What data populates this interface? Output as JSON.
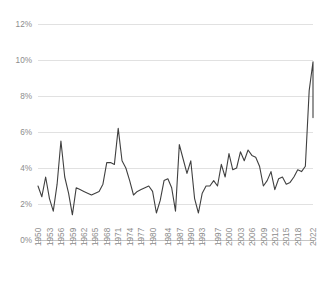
{
  "chart_data": {
    "type": "line",
    "title": "",
    "subtitle": "",
    "xlabel": "",
    "ylabel": "",
    "grid": true,
    "legend": false,
    "legend_position": "none",
    "line_color": "#404040",
    "grid_color": "#d9d9d9",
    "axis_text_color": "#8c8c8c",
    "ylim": [
      0,
      12
    ],
    "ytick_step": 2,
    "ytick_labels": [
      "0%",
      "2%",
      "4%",
      "6%",
      "8%",
      "10%",
      "12%"
    ],
    "ytick_values": [
      0,
      2,
      4,
      6,
      8,
      10,
      12
    ],
    "xlim": [
      1950,
      2022
    ],
    "xtick_labels": [
      "1950",
      "1953",
      "1956",
      "1959",
      "1962",
      "1965",
      "1968",
      "1971",
      "1974",
      "1977",
      "1980",
      "1984",
      "1987",
      "1990",
      "1993",
      "1997",
      "2000",
      "2003",
      "2006",
      "2009",
      "2012",
      "2015",
      "2018",
      "2022"
    ],
    "xtick_values": [
      1950,
      1953,
      1956,
      1959,
      1962,
      1965,
      1968,
      1971,
      1974,
      1977,
      1980,
      1984,
      1987,
      1990,
      1993,
      1997,
      2000,
      2003,
      2006,
      2009,
      2012,
      2015,
      2018,
      2022
    ],
    "series": [
      {
        "name": "Inflation rate",
        "x": [
          1950,
          1951,
          1952,
          1953,
          1954,
          1955,
          1956,
          1957,
          1958,
          1959,
          1960,
          1961,
          1962,
          1963,
          1964,
          1965,
          1966,
          1967,
          1968,
          1969,
          1970,
          1971,
          1972,
          1973,
          1974,
          1975,
          1976,
          1977,
          1978,
          1979,
          1980,
          1981,
          1982,
          1983,
          1984,
          1985,
          1986,
          1987,
          1988,
          1989,
          1990,
          1991,
          1992,
          1993,
          1994,
          1995,
          1996,
          1997,
          1998,
          1999,
          2000,
          2001,
          2002,
          2003,
          2004,
          2005,
          2006,
          2007,
          2008,
          2009,
          2010,
          2011,
          2012,
          2013,
          2014,
          2015,
          2016,
          2017,
          2018,
          2019,
          2020,
          2021,
          2022
        ],
        "values": [
          3.0,
          2.4,
          3.5,
          2.3,
          1.6,
          3.1,
          5.5,
          3.5,
          2.6,
          1.4,
          2.9,
          2.8,
          2.7,
          2.6,
          2.5,
          2.6,
          2.7,
          3.1,
          4.3,
          4.3,
          4.2,
          6.2,
          4.4,
          4.0,
          3.3,
          2.5,
          2.7,
          2.8,
          2.9,
          3.0,
          2.7,
          1.5,
          2.2,
          3.3,
          3.4,
          2.9,
          1.6,
          5.3,
          4.5,
          3.7,
          4.4,
          2.3,
          1.5,
          2.6,
          3.0,
          3.0,
          3.3,
          3.0,
          4.2,
          3.5,
          4.8,
          3.9,
          4.0,
          4.9,
          4.4,
          5.0,
          4.7,
          4.6,
          4.1,
          3.0,
          3.3,
          3.8,
          2.8,
          3.4,
          3.5,
          3.1,
          3.2,
          3.5,
          3.9,
          3.8,
          4.1,
          8.3,
          9.9
        ],
        "end_value": 6.8
      }
    ],
    "annotations": [],
    "peaks": [
      {
        "label": "1956 peak",
        "value": 5.5
      },
      {
        "label": "1971 peak",
        "value": 6.2
      },
      {
        "label": "1987 peak",
        "value": 5.3
      },
      {
        "label": "2021 peak",
        "value": 9.9
      }
    ],
    "troughs": [
      {
        "label": "1959 trough",
        "value": 1.4
      },
      {
        "label": "1981 trough",
        "value": 1.5
      },
      {
        "label": "1986 trough",
        "value": 1.6
      },
      {
        "label": "1992 trough",
        "value": 1.5
      }
    ]
  }
}
